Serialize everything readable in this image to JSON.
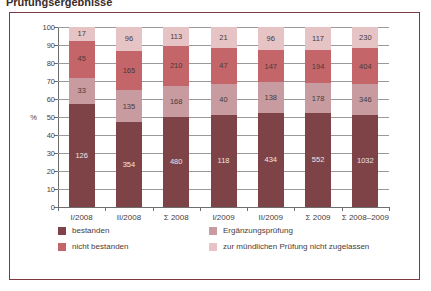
{
  "figure": {
    "title_cut": "Prüfungsergebnisse"
  },
  "axis": {
    "y_unit": "%",
    "y_ticks": [
      "0",
      "10",
      "20",
      "30",
      "40",
      "50",
      "60",
      "70",
      "80",
      "90",
      "100"
    ]
  },
  "legend": {
    "items": [
      {
        "label": "bestanden",
        "color": "#7d4347",
        "key": "bestanden"
      },
      {
        "label": "Ergänzungsprüfung",
        "color": "#c79ba0",
        "key": "ergaenzungspruefung"
      },
      {
        "label": "nicht bestanden",
        "color": "#c4656a",
        "key": "nicht_bestanden"
      },
      {
        "label": "zur mündlichen Prüfung nicht zugelassen",
        "color": "#e6c4c6",
        "key": "nicht_zugelassen"
      }
    ]
  },
  "chart_data": {
    "type": "bar",
    "stacked": true,
    "normalized": true,
    "title": "Prüfungsergebnisse",
    "xlabel": "",
    "ylabel": "%",
    "ylim": [
      0,
      100
    ],
    "grid": true,
    "legend_position": "bottom",
    "categories": [
      "I/2008",
      "II/2008",
      "Σ 2008",
      "I/2009",
      "II/2009",
      "Σ 2009",
      "Σ 2008–2009"
    ],
    "series": [
      {
        "name": "bestanden",
        "color": "#7d4347",
        "label_color": "#f2e4e2",
        "values": [
          126,
          354,
          480,
          118,
          434,
          552,
          1032
        ],
        "percent": [
          57.0,
          47.0,
          50.0,
          51.0,
          52.5,
          52.0,
          51.0
        ]
      },
      {
        "name": "Ergänzungsprüfung",
        "color": "#c79ba0",
        "label_color": "#4a3a38",
        "values": [
          33,
          135,
          168,
          40,
          138,
          178,
          346
        ],
        "percent": [
          14.9,
          17.9,
          17.5,
          17.3,
          16.7,
          16.8,
          17.1
        ]
      },
      {
        "name": "nicht bestanden",
        "color": "#c4656a",
        "label_color": "#4a3a38",
        "values": [
          45,
          165,
          210,
          47,
          147,
          194,
          404
        ],
        "percent": [
          20.4,
          21.9,
          21.9,
          20.3,
          17.8,
          18.3,
          20.0
        ]
      },
      {
        "name": "zur mündlichen Prüfung nicht zugelassen",
        "color": "#e6c4c6",
        "label_color": "#4a3a38",
        "values": [
          17,
          96,
          113,
          21,
          96,
          117,
          230
        ],
        "percent": [
          7.7,
          13.2,
          10.6,
          11.4,
          13.0,
          12.9,
          11.9
        ]
      }
    ]
  }
}
